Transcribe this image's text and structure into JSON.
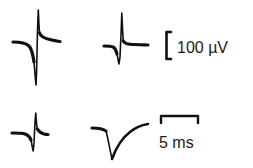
{
  "figure": {
    "type": "electrophysiology-waveforms",
    "trace_color": "#111111",
    "background": "#ffffff",
    "traces": [
      {
        "id": "trace-1",
        "position": "top-left",
        "shape": "biphasic spike, large negative deflection"
      },
      {
        "id": "trace-2",
        "position": "top-middle",
        "shape": "biphasic spike"
      },
      {
        "id": "trace-3",
        "position": "bottom-left",
        "shape": "biphasic spike, small"
      },
      {
        "id": "trace-4",
        "position": "bottom-middle",
        "shape": "monophasic negative deflection with slow recovery"
      }
    ],
    "scale_bars": {
      "amplitude": {
        "label": "100 µV",
        "orientation": "vertical"
      },
      "time": {
        "label": "5 ms",
        "orientation": "horizontal"
      }
    }
  }
}
